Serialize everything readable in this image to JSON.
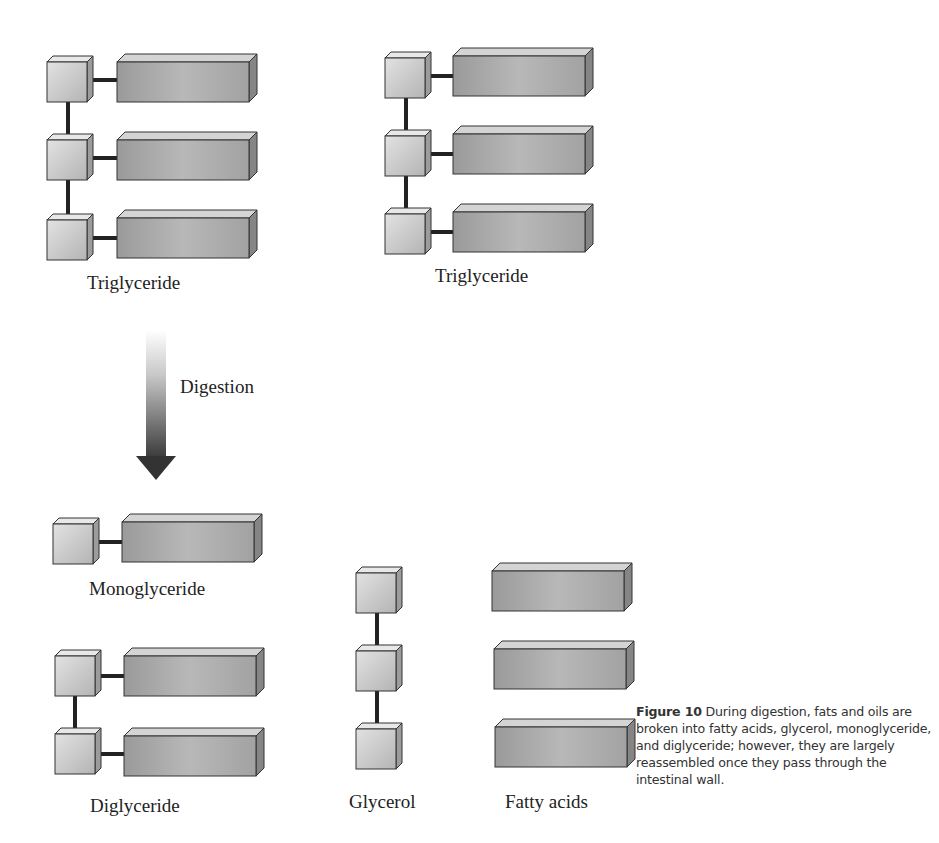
{
  "diagram": {
    "colors": {
      "glycerol_face": "#c8c8c8",
      "glycerol_edge": "#333333",
      "fatty_acid_face": "#a9a9a9",
      "fatty_acid_top": "#d2d2d2",
      "fatty_acid_side": "#8a8a8a",
      "bond": "#222222",
      "arrow_top": "#f0f0f0",
      "arrow_bottom": "#333333"
    },
    "labels": {
      "triglyceride_left": "Triglyceride",
      "triglyceride_right": "Triglyceride",
      "digestion": "Digestion",
      "monoglyceride": "Monoglyceride",
      "diglyceride": "Diglyceride",
      "glycerol": "Glycerol",
      "fatty_acids": "Fatty acids"
    },
    "molecules": [
      {
        "name": "Triglyceride",
        "glycerol_units": 3,
        "fatty_acids": 3
      },
      {
        "name": "Triglyceride",
        "glycerol_units": 3,
        "fatty_acids": 3
      },
      {
        "name": "Monoglyceride",
        "glycerol_units": 1,
        "fatty_acids": 1
      },
      {
        "name": "Diglyceride",
        "glycerol_units": 2,
        "fatty_acids": 2
      },
      {
        "name": "Glycerol",
        "glycerol_units": 3,
        "fatty_acids": 0
      },
      {
        "name": "Fatty acids",
        "glycerol_units": 0,
        "fatty_acids": 3
      }
    ]
  },
  "caption": {
    "figure_label": "Figure 10",
    "text": "During digestion, fats and oils are broken into fatty acids, glycerol, monoglyceride, and diglyceride; however, they are largely reassembled once they pass through the intestinal wall."
  }
}
